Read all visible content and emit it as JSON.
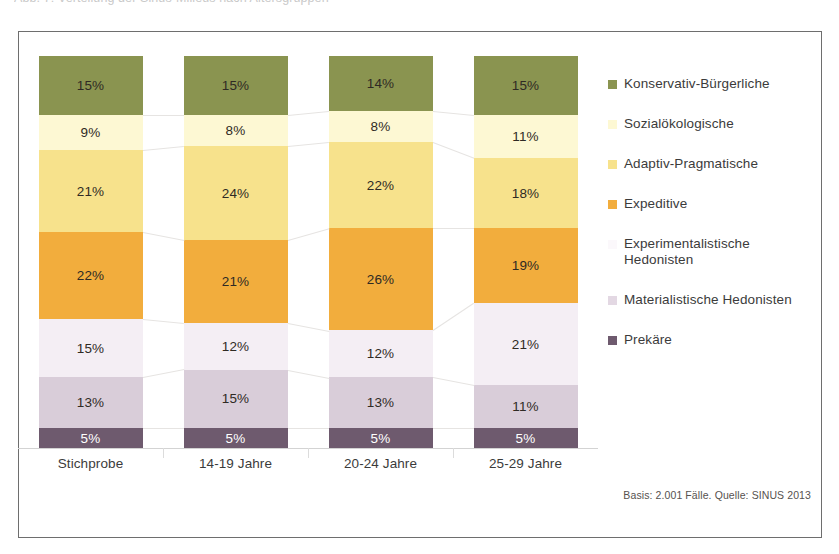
{
  "top_cut_text": "Abb. 7: Verteilung der Sinus-Milieus nach Altersgruppen",
  "chart_data": {
    "type": "bar",
    "stacked": true,
    "orientation": "vertical",
    "title": "",
    "xlabel": "",
    "ylabel": "",
    "ylim": [
      0,
      100
    ],
    "grid": false,
    "legend_position": "right",
    "categories": [
      "Stichprobe",
      "14-19 Jahre",
      "20-24 Jahre",
      "25-29 Jahre"
    ],
    "value_suffix": "%",
    "series": [
      {
        "name": "Konservativ-Bürgerliche",
        "color": "#8a9450",
        "label_color": "dark",
        "values": [
          15,
          15,
          14,
          15
        ],
        "labels": [
          "15%",
          "15%",
          "14%",
          "15%"
        ]
      },
      {
        "name": "Sozialökologische",
        "color": "#fdf8d3",
        "label_color": "dark",
        "values": [
          9,
          8,
          8,
          11
        ],
        "labels": [
          "9%",
          "8%",
          "8%",
          "11%"
        ]
      },
      {
        "name": "Adaptiv-Pragmatische",
        "color": "#f7e28c",
        "label_color": "dark",
        "values": [
          21,
          24,
          22,
          18
        ],
        "labels": [
          "21%",
          "24%",
          "22%",
          "18%"
        ]
      },
      {
        "name": "Expeditive",
        "color": "#f2ad3d",
        "label_color": "dark",
        "values": [
          22,
          21,
          26,
          19
        ],
        "labels": [
          "22%",
          "21%",
          "26%",
          "19%"
        ]
      },
      {
        "name": "Experimentalistische Hedonisten",
        "color": "#f4eef4",
        "label_color": "dark",
        "values": [
          15,
          12,
          12,
          21
        ],
        "labels": [
          "15%",
          "12%",
          "12%",
          "21%"
        ]
      },
      {
        "name": "Materialistische Hedonisten",
        "color": "#d9cdd9",
        "label_color": "dark",
        "values": [
          13,
          15,
          13,
          11
        ],
        "labels": [
          "13%",
          "15%",
          "13%",
          "11%"
        ]
      },
      {
        "name": "Prekäre",
        "color": "#6e5a6e",
        "label_color": "light",
        "values": [
          5,
          5,
          5,
          5
        ],
        "labels": [
          "5%",
          "5%",
          "5%",
          "5%"
        ]
      }
    ]
  },
  "legend": {
    "items": [
      {
        "label": "Konservativ-Bürgerliche",
        "color": "#8a9450"
      },
      {
        "label": "Sozialökologische",
        "color": "#fdf8d3"
      },
      {
        "label": "Adaptiv-Pragmatische",
        "color": "#f7e28c"
      },
      {
        "label": "Expeditive",
        "color": "#f2ad3d"
      },
      {
        "label": "Experimentalistische Hedonisten",
        "color": "#fbf8fb"
      },
      {
        "label": "Materialistische Hedonisten",
        "color": "#e3d8e3"
      },
      {
        "label": "Prekäre",
        "color": "#6e5a6e"
      }
    ]
  },
  "source_note": "Basis: 2.001 Fälle. Quelle: SINUS 2013"
}
